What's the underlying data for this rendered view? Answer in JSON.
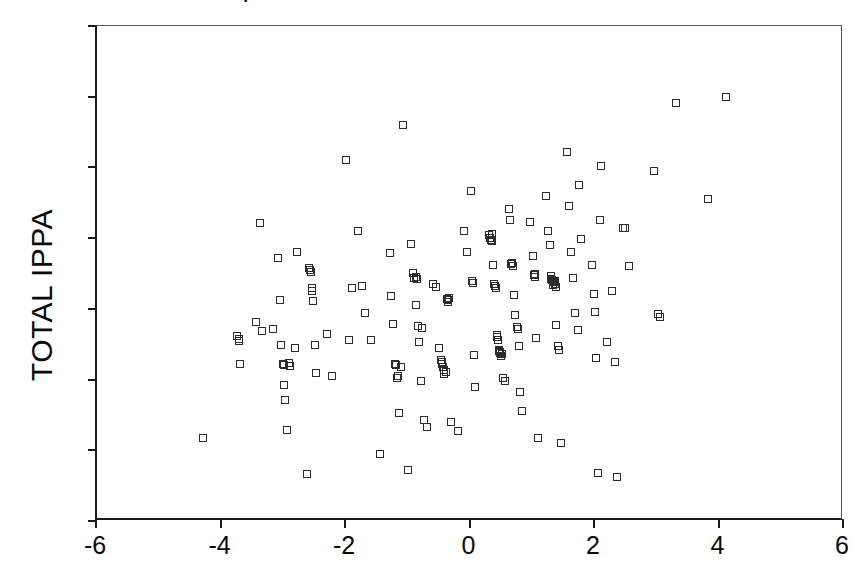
{
  "figure": {
    "title_fragment": "|",
    "background_color": "#ffffff",
    "frame_color": "#1a1a1a",
    "marker_color": "#2b2b2b"
  },
  "chart_data": {
    "type": "scatter",
    "title": "",
    "xlabel": "",
    "ylabel": "TOTAL IPPA",
    "xlim": [
      -6,
      6
    ],
    "ylim": [
      -60,
      80
    ],
    "xticks": [
      -6,
      -4,
      -2,
      0,
      2,
      4,
      6
    ],
    "xtick_labels": [
      "-6",
      "-4",
      "-2",
      "0",
      "2",
      "4",
      "6"
    ],
    "yticks": [
      -60,
      -40,
      -20,
      0,
      20,
      40,
      60,
      80
    ],
    "ytick_labels": [
      "-60",
      "-40",
      "-20",
      "0",
      "20",
      "40",
      "60",
      "80"
    ],
    "grid": false,
    "legend": null,
    "marker": "open-square",
    "marker_size": 8,
    "n_points": 168,
    "points": [
      [
        -4.3,
        -36.5
      ],
      [
        -3.75,
        -7.8
      ],
      [
        -3.72,
        -9.2
      ],
      [
        -3.7,
        -15.7
      ],
      [
        -3.45,
        -3.6
      ],
      [
        -3.38,
        24.3
      ],
      [
        -3.35,
        -6.2
      ],
      [
        -3.18,
        -5.7
      ],
      [
        -3.1,
        14.4
      ],
      [
        -3.06,
        2.5
      ],
      [
        -3.05,
        -10.2
      ],
      [
        -3.02,
        -15.6
      ],
      [
        -3.0,
        -21.5
      ],
      [
        -2.98,
        -25.7
      ],
      [
        -2.95,
        -34.2
      ],
      [
        -2.9,
        -16.1
      ],
      [
        -2.82,
        -11.0
      ],
      [
        -2.78,
        16.2
      ],
      [
        -2.62,
        -46.6
      ],
      [
        -2.6,
        11.6
      ],
      [
        -2.58,
        11.0
      ],
      [
        -2.55,
        5.8
      ],
      [
        -2.53,
        2.3
      ],
      [
        -2.5,
        -10.3
      ],
      [
        -2.48,
        -18.0
      ],
      [
        -2.3,
        -7.0
      ],
      [
        -2.22,
        -19.0
      ],
      [
        -2.0,
        42.0
      ],
      [
        -1.95,
        -8.9
      ],
      [
        -1.9,
        5.8
      ],
      [
        -1.8,
        22.0
      ],
      [
        -1.75,
        6.5
      ],
      [
        -1.7,
        -1.3
      ],
      [
        -1.6,
        -8.8
      ],
      [
        -1.45,
        -41.0
      ],
      [
        -1.3,
        15.8
      ],
      [
        -1.28,
        3.5
      ],
      [
        -1.25,
        -4.2
      ],
      [
        -1.2,
        -16.0
      ],
      [
        -1.18,
        -19.5
      ],
      [
        -1.15,
        -29.5
      ],
      [
        -1.08,
        52.0
      ],
      [
        -1.0,
        -45.5
      ],
      [
        -0.95,
        18.3
      ],
      [
        -0.92,
        10.2
      ],
      [
        -0.9,
        8.8
      ],
      [
        -0.88,
        1.2
      ],
      [
        -0.85,
        -4.9
      ],
      [
        -0.82,
        -9.5
      ],
      [
        -0.8,
        -20.5
      ],
      [
        -0.75,
        -31.5
      ],
      [
        -0.7,
        -33.5
      ],
      [
        -0.6,
        7.0
      ],
      [
        -0.55,
        6.2
      ],
      [
        -0.5,
        -11.0
      ],
      [
        -0.48,
        -14.5
      ],
      [
        -0.45,
        -15.5
      ],
      [
        -0.42,
        -17.2
      ],
      [
        -0.4,
        -17.9
      ],
      [
        -0.38,
        2.8
      ],
      [
        -0.36,
        2.4
      ],
      [
        -0.34,
        3.0
      ],
      [
        -0.32,
        -32.0
      ],
      [
        -0.2,
        -34.5
      ],
      [
        -0.1,
        22.0
      ],
      [
        -0.05,
        16.0
      ],
      [
        0.0,
        33.2
      ],
      [
        0.02,
        8.0
      ],
      [
        0.04,
        7.2
      ],
      [
        0.06,
        -13.0
      ],
      [
        0.08,
        -22.0
      ],
      [
        0.3,
        20.8
      ],
      [
        0.32,
        20.0
      ],
      [
        0.34,
        19.2
      ],
      [
        0.36,
        12.5
      ],
      [
        0.38,
        7.0
      ],
      [
        0.4,
        6.5
      ],
      [
        0.42,
        -7.5
      ],
      [
        0.44,
        -8.8
      ],
      [
        0.46,
        -12.0
      ],
      [
        0.48,
        -12.5
      ],
      [
        0.5,
        -12.8
      ],
      [
        0.52,
        -19.5
      ],
      [
        0.55,
        -20.5
      ],
      [
        0.62,
        28.2
      ],
      [
        0.64,
        25.0
      ],
      [
        0.66,
        13.0
      ],
      [
        0.68,
        12.2
      ],
      [
        0.7,
        4.0
      ],
      [
        0.72,
        -1.8
      ],
      [
        0.74,
        -5.0
      ],
      [
        0.76,
        -5.8
      ],
      [
        0.78,
        -10.5
      ],
      [
        0.8,
        -23.5
      ],
      [
        0.82,
        -29.0
      ],
      [
        0.95,
        24.5
      ],
      [
        1.0,
        15.0
      ],
      [
        1.02,
        9.5
      ],
      [
        1.04,
        9.0
      ],
      [
        1.06,
        -8.2
      ],
      [
        1.08,
        -36.5
      ],
      [
        1.22,
        31.8
      ],
      [
        1.25,
        22.0
      ],
      [
        1.28,
        18.0
      ],
      [
        1.3,
        8.5
      ],
      [
        1.32,
        8.0
      ],
      [
        1.34,
        7.5
      ],
      [
        1.36,
        7.0
      ],
      [
        1.38,
        -4.5
      ],
      [
        1.4,
        -10.5
      ],
      [
        1.42,
        -11.5
      ],
      [
        1.45,
        -38.0
      ],
      [
        1.55,
        44.5
      ],
      [
        1.58,
        29.0
      ],
      [
        1.62,
        16.2
      ],
      [
        1.65,
        8.8
      ],
      [
        1.68,
        -1.2
      ],
      [
        1.72,
        -6.0
      ],
      [
        1.75,
        35.0
      ],
      [
        1.78,
        19.8
      ],
      [
        1.95,
        12.5
      ],
      [
        1.98,
        4.2
      ],
      [
        2.0,
        -0.8
      ],
      [
        2.02,
        -13.8
      ],
      [
        2.05,
        -46.5
      ],
      [
        2.08,
        25.0
      ],
      [
        2.1,
        40.3
      ],
      [
        2.2,
        -9.5
      ],
      [
        2.28,
        5.0
      ],
      [
        2.32,
        -15.0
      ],
      [
        2.35,
        -47.5
      ],
      [
        2.45,
        22.8
      ],
      [
        2.55,
        12.0
      ],
      [
        2.95,
        39.0
      ],
      [
        3.02,
        -1.5
      ],
      [
        3.05,
        -2.3
      ],
      [
        3.3,
        58.2
      ],
      [
        3.82,
        31.0
      ],
      [
        4.1,
        60.0
      ],
      [
        -3.72,
        -8.4
      ],
      [
        -3.0,
        -16.0
      ],
      [
        -2.55,
        5.0
      ],
      [
        -1.22,
        -15.5
      ],
      [
        -0.88,
        9.0
      ],
      [
        -0.44,
        -16.5
      ],
      [
        0.33,
        19.5
      ],
      [
        0.45,
        -11.5
      ],
      [
        1.33,
        6.8
      ],
      [
        1.35,
        7.8
      ],
      [
        0.43,
        -8.0
      ],
      [
        -0.36,
        2.0
      ],
      [
        -0.42,
        -18.5
      ],
      [
        0.47,
        -12.2
      ],
      [
        1.31,
        8.2
      ],
      [
        -2.57,
        10.5
      ],
      [
        -0.86,
        8.4
      ],
      [
        0.65,
        12.8
      ],
      [
        1.03,
        9.8
      ],
      [
        -1.16,
        -19.0
      ],
      [
        0.35,
        21.2
      ],
      [
        1.29,
        9.2
      ],
      [
        -0.46,
        -15.0
      ],
      [
        0.49,
        -13.2
      ],
      [
        -2.92,
        -15.2
      ],
      [
        -0.78,
        -5.5
      ],
      [
        1.37,
        6.2
      ],
      [
        0.41,
        6.0
      ],
      [
        2.48,
        23.0
      ],
      [
        -1.12,
        -16.5
      ]
    ]
  },
  "axes": {
    "y_title": "TOTAL IPPA"
  }
}
